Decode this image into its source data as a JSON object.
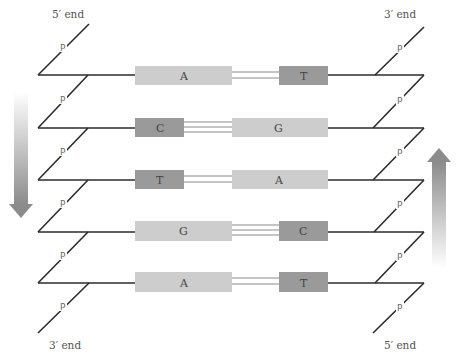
{
  "ends": {
    "top_left": "5′ end",
    "top_right": "3′ end",
    "bottom_left": "3′ end",
    "bottom_right": "5′ end"
  },
  "phosphate_label": "P",
  "colors": {
    "backbone": "#2b2b2b",
    "purine_box": "#cdcdcd",
    "pyrimidine_box": "#9a9a9a",
    "hbond": "#8a8a8a",
    "arrow_dark": "#8c8c8c",
    "arrow_light": "#f2f2f2"
  },
  "base_pairs": [
    {
      "left": "A",
      "right": "T",
      "left_type": "purine",
      "right_type": "pyrimidine",
      "hbonds": 2
    },
    {
      "left": "C",
      "right": "G",
      "left_type": "pyrimidine",
      "right_type": "purine",
      "hbonds": 3
    },
    {
      "left": "T",
      "right": "A",
      "left_type": "pyrimidine",
      "right_type": "purine",
      "hbonds": 2
    },
    {
      "left": "G",
      "right": "C",
      "left_type": "purine",
      "right_type": "pyrimidine",
      "hbonds": 3
    },
    {
      "left": "A",
      "right": "T",
      "left_type": "purine",
      "right_type": "pyrimidine",
      "hbonds": 2
    }
  ],
  "arrows": {
    "left": "down",
    "right": "up"
  }
}
